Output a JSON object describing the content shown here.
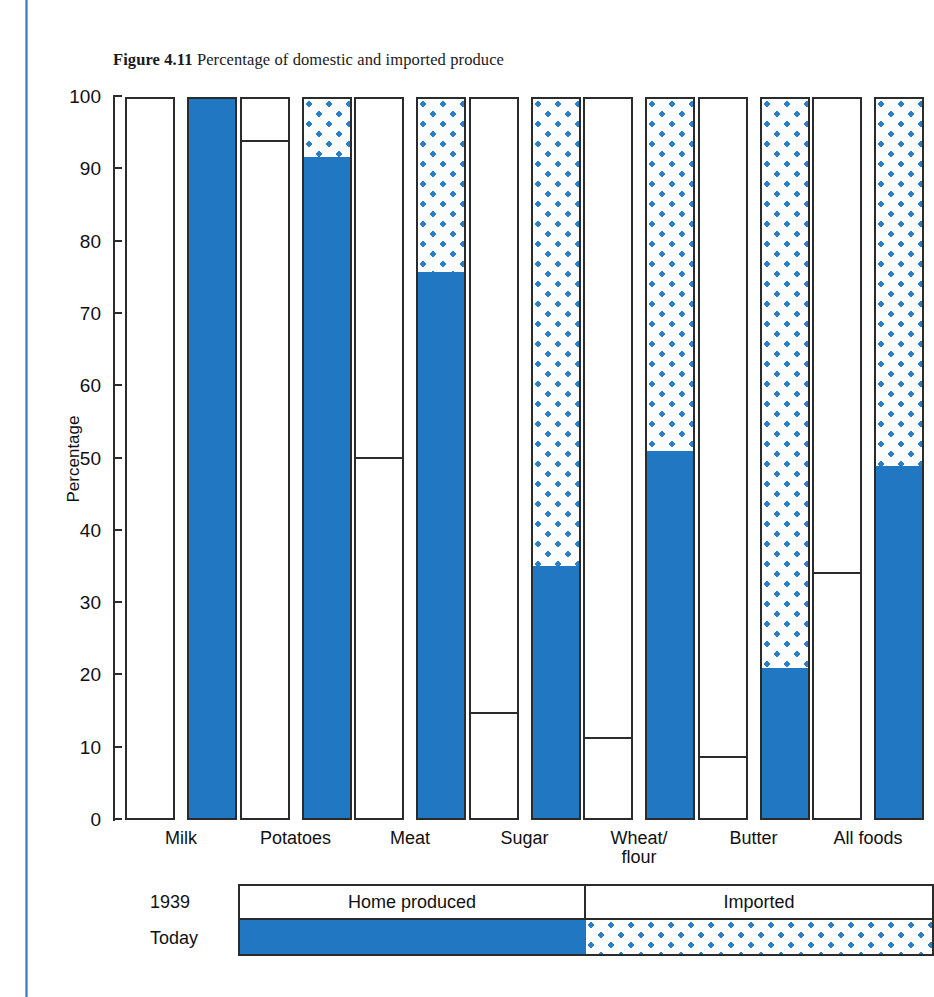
{
  "caption": {
    "figure_number": "Figure 4.11",
    "text": "Percentage of domestic and imported produce"
  },
  "legend": {
    "rows": [
      {
        "label": "1939",
        "home": "Home produced",
        "imported": "Imported"
      },
      {
        "label": "Today",
        "home": "",
        "imported": ""
      }
    ]
  },
  "colors": {
    "solid_blue": "#2077c2",
    "dot_blue": "#2a7fc9",
    "dot_background": "#fbfdff",
    "outline": "#2b2b2b",
    "page_rule": "#3d79c0"
  },
  "chart_data": {
    "type": "bar",
    "title": "Percentage of domestic and imported produce",
    "xlabel": "",
    "ylabel": "Percentage",
    "ylim": [
      0,
      100
    ],
    "yticks": [
      0,
      10,
      20,
      30,
      40,
      50,
      60,
      70,
      80,
      90,
      100
    ],
    "ytick_labels": [
      "0",
      "10",
      "20",
      "30",
      "40",
      "50",
      "60",
      "70",
      "80",
      "90",
      "100"
    ],
    "grid": false,
    "legend_position": "bottom",
    "categories": [
      "Milk",
      "Potatoes",
      "Meat",
      "Sugar",
      "Wheat/ flour",
      "Butter",
      "All foods"
    ],
    "series": [
      {
        "name": "1939",
        "description": "Home produced percentage in 1939",
        "values": [
          100,
          94,
          50,
          14.5,
          11,
          8.3,
          34
        ]
      },
      {
        "name": "Today",
        "description": "Home produced percentage today",
        "values": [
          100,
          92,
          76,
          35,
          51,
          20.8,
          49
        ]
      }
    ],
    "imported_series": [
      {
        "name": "1939 imported",
        "values": [
          0,
          6,
          50,
          85.5,
          89,
          91.7,
          66
        ]
      },
      {
        "name": "Today imported",
        "values": [
          0,
          8,
          24,
          65,
          49,
          79.2,
          51
        ]
      }
    ]
  }
}
